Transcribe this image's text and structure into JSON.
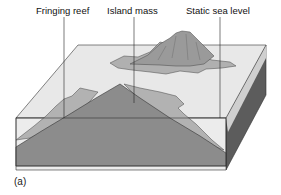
{
  "labels": {
    "fringing_reef": "Fringing reef",
    "island_mass": "Island mass",
    "static_sea_level": "Static sea level"
  },
  "figure_label": "(a)",
  "colors": {
    "water_top": "#e6e6e6",
    "water_front": "#ececec",
    "island": "#8e8e8e",
    "reef": "#b4b4b4",
    "side_dark": "#5a5a5a",
    "outline": "#333333"
  }
}
